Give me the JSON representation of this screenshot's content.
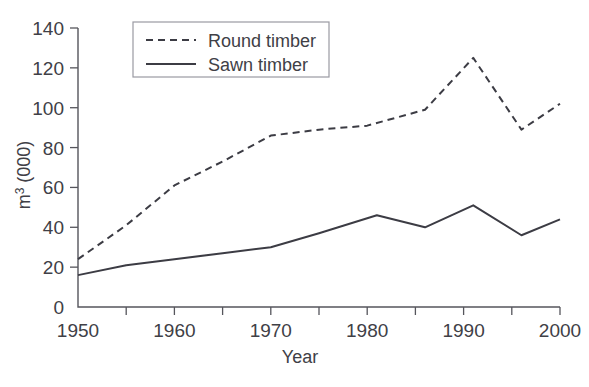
{
  "chart_data": {
    "type": "line",
    "title": "",
    "xlabel": "Year",
    "ylabel": "m3 (000)",
    "ylabel_base": "m",
    "ylabel_sup": "3",
    "ylabel_tail": " (000)",
    "xlim": [
      1950,
      2000
    ],
    "ylim": [
      0,
      140
    ],
    "grid": false,
    "legend_position": "top-left-inside",
    "x_ticks": [
      1950,
      1955,
      1960,
      1965,
      1970,
      1975,
      1980,
      1985,
      1990,
      1995,
      2000
    ],
    "x_tick_labels": [
      "1950",
      "",
      "1960",
      "",
      "1970",
      "",
      "1980",
      "",
      "1990",
      "",
      "2000"
    ],
    "y_ticks": [
      0,
      20,
      40,
      60,
      80,
      100,
      120,
      140
    ],
    "y_tick_labels": [
      "0",
      "20",
      "40",
      "60",
      "80",
      "100",
      "120",
      "140"
    ],
    "series": [
      {
        "name": "Round timber",
        "style": "dashed",
        "color": "#3c3c44",
        "x": [
          1950,
          1955,
          1960,
          1965,
          1970,
          1975,
          1980,
          1986,
          1991,
          1996,
          2000
        ],
        "values": [
          24,
          41,
          61,
          73,
          86,
          89,
          91,
          99,
          125,
          89,
          102
        ]
      },
      {
        "name": "Sawn timber",
        "style": "solid",
        "color": "#3c3c44",
        "x": [
          1950,
          1955,
          1960,
          1965,
          1970,
          1975,
          1981,
          1986,
          1991,
          1996,
          2000
        ],
        "values": [
          16,
          21,
          24,
          27,
          30,
          37,
          46,
          40,
          51,
          36,
          44
        ]
      }
    ]
  },
  "legend": {
    "items": [
      {
        "label": "Round timber",
        "style": "dashed"
      },
      {
        "label": "Sawn timber",
        "style": "solid"
      }
    ]
  }
}
